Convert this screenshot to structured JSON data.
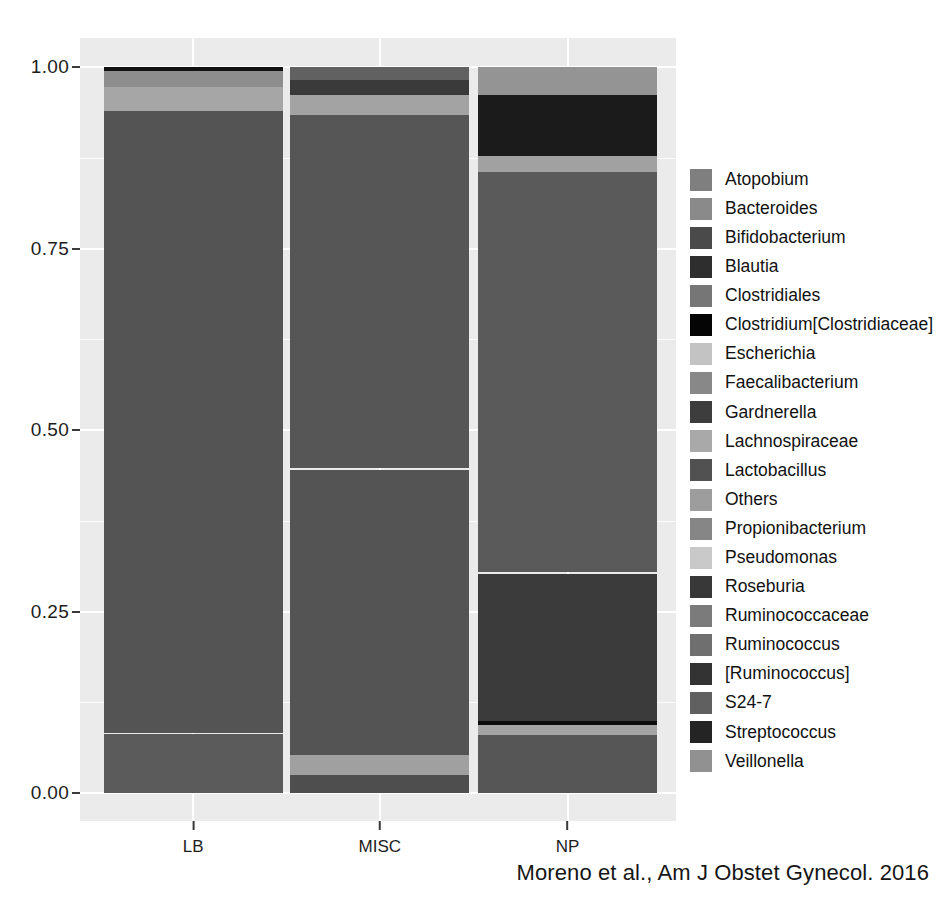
{
  "caption": "Moreno et al., Am J Obstet Gynecol. 2016",
  "axes": {
    "y_ticks": [
      "0.00",
      "0.25",
      "0.50",
      "0.75",
      "1.00"
    ],
    "x_ticks": [
      "LB",
      "MISC",
      "NP"
    ]
  },
  "legend": {
    "items": [
      {
        "label": "Atopobium",
        "color": "#7f7f7f"
      },
      {
        "label": "Bacteroides",
        "color": "#8a8a8a"
      },
      {
        "label": "Bifidobacterium",
        "color": "#4a4a4a"
      },
      {
        "label": "Blautia",
        "color": "#2e2e2e"
      },
      {
        "label": "Clostridiales",
        "color": "#767676"
      },
      {
        "label": "Clostridium[Clostridiaceae]",
        "color": "#050505"
      },
      {
        "label": "Escherichia",
        "color": "#c3c3c3"
      },
      {
        "label": "Faecalibacterium",
        "color": "#888888"
      },
      {
        "label": "Gardnerella",
        "color": "#3d3d3d"
      },
      {
        "label": "Lachnospiraceae",
        "color": "#a9a9a9"
      },
      {
        "label": "Lactobacillus",
        "color": "#515151"
      },
      {
        "label": "Others",
        "color": "#9d9d9d"
      },
      {
        "label": "Propionibacterium",
        "color": "#868686"
      },
      {
        "label": "Pseudomonas",
        "color": "#c9c9c9"
      },
      {
        "label": "Roseburia",
        "color": "#383838"
      },
      {
        "label": "Ruminococcaceae",
        "color": "#7b7b7b"
      },
      {
        "label": "Ruminococcus",
        "color": "#6f6f6f"
      },
      {
        "label": "[Ruminococcus]",
        "color": "#333333"
      },
      {
        "label": "S24-7",
        "color": "#606060"
      },
      {
        "label": "Streptococcus",
        "color": "#242424"
      },
      {
        "label": "Veillonella",
        "color": "#919191"
      }
    ]
  },
  "chart_data": {
    "type": "bar",
    "title": "",
    "subtitle": "",
    "xlabel": "",
    "ylabel": "",
    "ylim": [
      0.0,
      1.0
    ],
    "grid": true,
    "stacked": true,
    "normalized": true,
    "legend_position": "right",
    "categories": [
      "LB",
      "MISC",
      "NP"
    ],
    "series": [
      {
        "name": "Atopobium",
        "color": "#7f7f7f",
        "values": [
          0.0,
          0.0,
          0.0
        ]
      },
      {
        "name": "Bacteroides",
        "color": "#8a8a8a",
        "values": [
          0.0,
          0.0,
          0.0
        ]
      },
      {
        "name": "Bifidobacterium",
        "color": "#4a4a4a",
        "values": [
          0.0,
          0.0,
          0.0
        ]
      },
      {
        "name": "Blautia",
        "color": "#2e2e2e",
        "values": [
          0.0,
          0.0,
          0.0
        ]
      },
      {
        "name": "Clostridiales",
        "color": "#767676",
        "values": [
          0.0,
          0.0,
          0.0
        ]
      },
      {
        "name": "Clostridium[Clostridiaceae]",
        "color": "#050505",
        "values": [
          0.006,
          0.0,
          0.0
        ]
      },
      {
        "name": "Escherichia",
        "color": "#c3c3c3",
        "values": [
          0.0,
          0.0,
          0.0
        ]
      },
      {
        "name": "Faecalibacterium",
        "color": "#888888",
        "values": [
          0.022,
          0.0,
          0.0
        ]
      },
      {
        "name": "Gardnerella",
        "color": "#3d3d3d",
        "values": [
          0.0,
          0.02,
          0.0
        ]
      },
      {
        "name": "Lachnospiraceae",
        "color": "#a9a9a9",
        "values": [
          0.032,
          0.028,
          0.035
        ]
      },
      {
        "name": "Lactobacillus",
        "color": "#515151",
        "values": [
          0.828,
          0.448,
          0.702
        ]
      },
      {
        "name": "Others",
        "color": "#9d9d9d",
        "values": [
          0.0,
          0.0,
          0.02
        ]
      },
      {
        "name": "Propionibacterium",
        "color": "#868686",
        "values": [
          0.0,
          0.02,
          0.0
        ]
      },
      {
        "name": "Pseudomonas",
        "color": "#c9c9c9",
        "values": [
          0.0,
          0.0,
          0.0
        ]
      },
      {
        "name": "Roseburia",
        "color": "#383838",
        "values": [
          0.0,
          0.0,
          0.0
        ]
      },
      {
        "name": "Ruminococcaceae",
        "color": "#7b7b7b",
        "values": [
          0.0,
          0.0,
          0.0
        ]
      },
      {
        "name": "Ruminococcus",
        "color": "#6f6f6f",
        "values": [
          0.0,
          0.0,
          0.0
        ]
      },
      {
        "name": "[Ruminococcus]",
        "color": "#333333",
        "values": [
          0.0,
          0.0,
          0.0
        ]
      },
      {
        "name": "S24-7",
        "color": "#606060",
        "values": [
          0.0,
          0.0,
          0.0
        ]
      },
      {
        "name": "Streptococcus",
        "color": "#242424",
        "values": [
          0.0,
          0.0,
          0.0
        ]
      },
      {
        "name": "Veillonella",
        "color": "#919191",
        "values": [
          0.0,
          0.0,
          0.0
        ]
      }
    ],
    "bars": [
      {
        "category": "LB",
        "segments": [
          {
            "name": "Clostridium[Clostridiaceae]",
            "color": "#121212",
            "from": 0.994,
            "to": 1.0
          },
          {
            "name": "Faecalibacterium",
            "color": "#8d8d8d",
            "from": 0.972,
            "to": 0.994
          },
          {
            "name": "Lachnospiraceae",
            "color": "#a6a6a6",
            "from": 0.94,
            "to": 0.972
          },
          {
            "name": "Lactobacillus",
            "color": "#545454",
            "from": 0.083,
            "to": 0.94
          },
          {
            "name": "Others",
            "color": "#5b5b5b",
            "from": 0.0,
            "to": 0.081
          }
        ]
      },
      {
        "category": "MISC",
        "segments": [
          {
            "name": "Bacteroides",
            "color": "#616161",
            "from": 0.982,
            "to": 1.0
          },
          {
            "name": "Gardnerella",
            "color": "#3a3a3a",
            "from": 0.962,
            "to": 0.982
          },
          {
            "name": "Lachnospiraceae",
            "color": "#a3a3a3",
            "from": 0.934,
            "to": 0.962
          },
          {
            "name": "Lactobacillus",
            "color": "#565656",
            "from": 0.448,
            "to": 0.934
          },
          {
            "name": "Ruminococcus",
            "color": "#545454",
            "from": 0.053,
            "to": 0.445
          },
          {
            "name": "Propionibacterium",
            "color": "#a0a0a0",
            "from": 0.025,
            "to": 0.053
          },
          {
            "name": "Streptococcus",
            "color": "#4e4e4e",
            "from": 0.0,
            "to": 0.025
          }
        ]
      },
      {
        "category": "NP",
        "segments": [
          {
            "name": "Veillonella",
            "color": "#949494",
            "from": 0.962,
            "to": 1.0
          },
          {
            "name": "Streptococcus",
            "color": "#1b1b1b",
            "from": 0.878,
            "to": 0.962
          },
          {
            "name": "Others",
            "color": "#a1a1a1",
            "from": 0.856,
            "to": 0.878
          },
          {
            "name": "Lactobacillus",
            "color": "#5a5a5a",
            "from": 0.304,
            "to": 0.856
          },
          {
            "name": "Roseburia",
            "color": "#3b3b3b",
            "from": 0.099,
            "to": 0.302
          },
          {
            "name": "Blautia",
            "color": "#0c0c0c",
            "from": 0.093,
            "to": 0.099
          },
          {
            "name": "Lachnospiraceae",
            "color": "#a4a4a4",
            "from": 0.08,
            "to": 0.093
          },
          {
            "name": "Bifidobacterium",
            "color": "#565656",
            "from": 0.0,
            "to": 0.08
          }
        ]
      }
    ]
  }
}
